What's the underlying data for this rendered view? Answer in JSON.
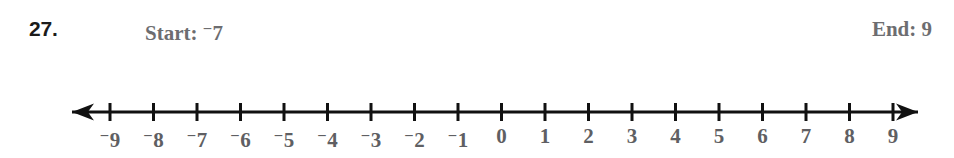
{
  "problem": {
    "number": "27.",
    "start_label": "Start:",
    "start_value": "7",
    "start_sign": "−",
    "end_label": "End:",
    "end_value": "9"
  },
  "colors": {
    "page_background": "#ffffff",
    "problem_number": "#1b1b1b",
    "header_text": "#6d6d70",
    "tick_label": "#5f5f63",
    "axis_line": "#111111"
  },
  "chart_data": {
    "type": "numberline",
    "title": "",
    "xlabel": "",
    "ylabel": "",
    "xlim": [
      -9,
      9
    ],
    "tick_step": 1,
    "grid": false,
    "legend": "none",
    "arrow_left": true,
    "arrow_right": true,
    "negative_sign_style": "raised-superscript-minus",
    "ticks": [
      -9,
      -8,
      -7,
      -6,
      -5,
      -4,
      -3,
      -2,
      -1,
      0,
      1,
      2,
      3,
      4,
      5,
      6,
      7,
      8,
      9
    ],
    "tick_labels": [
      "–9",
      "–8",
      "–7",
      "–6",
      "–5",
      "–4",
      "–3",
      "–2",
      "–1",
      "0",
      "1",
      "2",
      "3",
      "4",
      "5",
      "6",
      "7",
      "8",
      "9"
    ],
    "marked_points": [],
    "series": []
  },
  "geometry": {
    "axis_y": 24,
    "axis_left_x": 72,
    "axis_right_x": 918,
    "first_tick_x": 110,
    "tick_spacing": 43.5,
    "tick_half_height": 9,
    "line_width": 3
  }
}
